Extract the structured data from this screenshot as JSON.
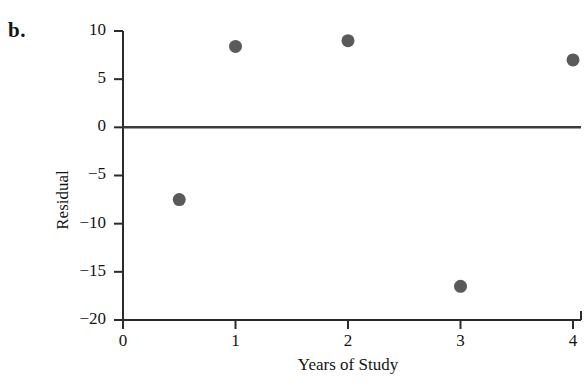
{
  "panel": {
    "label": "b."
  },
  "chart_data": {
    "type": "scatter",
    "title": "",
    "xlabel": "Years of Study",
    "ylabel": "Residual",
    "xlim": [
      0,
      4
    ],
    "ylim": [
      -20,
      10
    ],
    "xticks": [
      0,
      1,
      2,
      3,
      4
    ],
    "xticklabels": [
      "0",
      "1",
      "2",
      "3",
      "4"
    ],
    "yticks": [
      10,
      5,
      0,
      -5,
      -10,
      -15,
      -20
    ],
    "yticklabels": [
      "10",
      "5",
      "0",
      "−5",
      "−10",
      "−15",
      "−20"
    ],
    "grid": false,
    "legend": null,
    "reference_line": {
      "orientation": "horizontal",
      "y": 0,
      "color": "#3c3c3c"
    },
    "x": [
      0.5,
      1,
      2,
      3,
      4
    ],
    "y": [
      -7.5,
      8.4,
      9.0,
      -16.5,
      7.0
    ],
    "points": [
      {
        "x": 0.5,
        "y": -7.5
      },
      {
        "x": 1,
        "y": 8.4
      },
      {
        "x": 2,
        "y": 9.0
      },
      {
        "x": 3,
        "y": -16.5
      },
      {
        "x": 4,
        "y": 7.0
      }
    ],
    "marker": {
      "shape": "circle",
      "size": 13,
      "color": "#5a5a5a"
    },
    "axis_color": "#2b2b2b"
  }
}
